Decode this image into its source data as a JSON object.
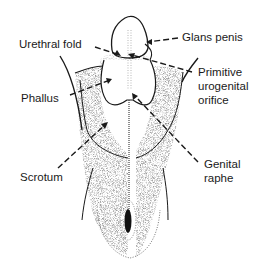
{
  "diagram": {
    "title": "",
    "labels": {
      "glans_penis": "Glans penis",
      "urethral_fold": "Urethral fold",
      "primitive_orifice_1": "Primitive",
      "primitive_orifice_2": "urogenital",
      "primitive_orifice_3": "orifice",
      "phallus": "Phallus",
      "scrotum": "Scrotum",
      "genital_raphe_1": "Genital",
      "genital_raphe_2": "raphe"
    },
    "colors": {
      "ink": "#1a1a1a",
      "background": "#ffffff"
    }
  }
}
